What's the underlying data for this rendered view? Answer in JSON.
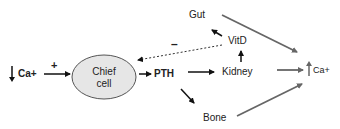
{
  "diagram": {
    "nodes": {
      "low_ca": {
        "arrow": "down",
        "label": "Ca+"
      },
      "chief_cell": {
        "line1": "Chief",
        "line2": "cell"
      },
      "pth": {
        "label": "PTH"
      },
      "kidney": {
        "label": "Kidney"
      },
      "vitd": {
        "label": "VitD"
      },
      "gut": {
        "label": "Gut"
      },
      "bone": {
        "label": "Bone"
      },
      "high_ca": {
        "arrow": "up",
        "label": "Ca+"
      }
    },
    "edges": [
      {
        "from": "low_ca",
        "to": "chief_cell",
        "sign": "+",
        "style": "solid",
        "color": "#111111"
      },
      {
        "from": "chief_cell",
        "to": "pth",
        "style": "solid",
        "color": "#111111"
      },
      {
        "from": "pth",
        "to": "kidney",
        "style": "solid",
        "color": "#111111"
      },
      {
        "from": "pth",
        "to": "bone",
        "style": "solid",
        "color": "#111111"
      },
      {
        "from": "kidney",
        "to": "vitd",
        "style": "solid",
        "color": "#111111"
      },
      {
        "from": "vitd",
        "to": "gut",
        "style": "solid",
        "color": "#111111"
      },
      {
        "from": "vitd",
        "to": "chief_cell",
        "sign": "–",
        "style": "dashed",
        "color": "#333333"
      },
      {
        "from": "gut",
        "to": "high_ca",
        "style": "solid",
        "color": "#666666"
      },
      {
        "from": "kidney",
        "to": "high_ca",
        "style": "solid",
        "color": "#666666"
      },
      {
        "from": "bone",
        "to": "high_ca",
        "style": "solid",
        "color": "#666666"
      }
    ],
    "signs": {
      "plus": "+",
      "minus": "–"
    },
    "colors": {
      "ellipse_fill": "#e6e6e6",
      "ellipse_stroke": "#555555",
      "gray_arrow": "#666666",
      "black_arrow": "#111111"
    }
  }
}
